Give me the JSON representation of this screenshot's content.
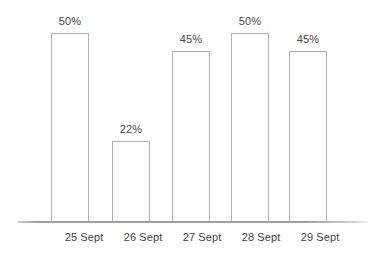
{
  "chart_data": {
    "type": "bar",
    "title": "",
    "subtitle": "",
    "xlabel": "",
    "ylabel": "",
    "categories": [
      "25 Sept",
      "26 Sept",
      "27 Sept",
      "28 Sept",
      "29 Sept"
    ],
    "values": [
      50,
      22,
      45,
      50,
      45
    ],
    "value_labels": [
      "50%",
      "22%",
      "45%",
      "50%",
      "45%"
    ],
    "ylim": [
      0,
      50
    ],
    "grid": false,
    "legend": false,
    "legend_position": "none",
    "annotations": []
  },
  "style": {
    "bar_fill": "#fcfcfc",
    "bar_stroke": "#b2b2b2",
    "axis_color": "#9e9e9e",
    "label_color": "#3f3f3f",
    "value_color": "#474747",
    "background": "#ffffff"
  },
  "bars": [
    {
      "label": "25 Sept",
      "value_label": "50%",
      "left": 51,
      "height": 189
    },
    {
      "label": "26 Sept",
      "value_label": "22%",
      "left": 112,
      "height": 81
    },
    {
      "label": "27 Sept",
      "value_label": "45%",
      "left": 172,
      "height": 171
    },
    {
      "label": "28 Sept",
      "value_label": "50%",
      "left": 231,
      "height": 189
    },
    {
      "label": "29 Sept",
      "value_label": "45%",
      "left": 289,
      "height": 171
    }
  ],
  "category_label_positions": [
    49,
    108,
    167,
    226,
    285
  ]
}
